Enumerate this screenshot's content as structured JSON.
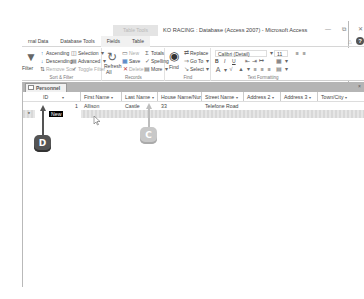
{
  "titlebar": {
    "context_tab_group": "Table Tools",
    "title": "KO RACING : Database (Access 2007) - Microsoft Access",
    "controls": {
      "minimize": "—",
      "restore": "⧉",
      "close": "✕"
    }
  },
  "ribbon_tabs": [
    {
      "label": "rnal Data"
    },
    {
      "label": "Database Tools"
    },
    {
      "label": "Fields"
    },
    {
      "label": "Table"
    }
  ],
  "ribbon": {
    "sort_filter": {
      "group_label": "Sort & Filter",
      "filter": "Filter",
      "ascending": "Ascending",
      "descending": "Descending",
      "remove_sort": "Remove Sort",
      "selection": "Selection",
      "advanced": "Advanced",
      "toggle_filter": "Toggle Filter"
    },
    "records": {
      "group_label": "Records",
      "refresh_all": "Refresh",
      "refresh_all_2": "All",
      "new": "New",
      "save": "Save",
      "delete": "Delete",
      "totals": "Totals",
      "spelling": "Spelling",
      "more": "More"
    },
    "find": {
      "group_label": "Find",
      "find": "Find",
      "replace": "Replace",
      "go_to": "Go To",
      "select": "Select"
    },
    "text_formatting": {
      "group_label": "Text Formatting",
      "font_name": "Calibri (Detail)",
      "font_size": "11",
      "bold": "B",
      "italic": "I",
      "underline": "U"
    }
  },
  "document": {
    "tab_label": "Personnel",
    "close": "×",
    "columns": [
      {
        "label": "ID",
        "width": 46
      },
      {
        "label": "First Name",
        "width": 41
      },
      {
        "label": "Last Name",
        "width": 36
      },
      {
        "label": "House Name/Nur",
        "width": 44
      },
      {
        "label": "Street Name",
        "width": 42
      },
      {
        "label": "Address 2",
        "width": 37
      },
      {
        "label": "Address 3",
        "width": 37
      },
      {
        "label": "Town/City",
        "width": 47
      }
    ],
    "rows": [
      {
        "id": "1",
        "first_name": "Allison",
        "last_name": "Castle",
        "house": "33",
        "street": "Telefone Road",
        "address2": "",
        "address3": "",
        "town": ""
      }
    ],
    "new_row": {
      "marker": "*",
      "id": "New"
    }
  },
  "callouts": [
    {
      "label": "D",
      "color": "#545454"
    },
    {
      "label": "C",
      "color": "#c8c8c8"
    }
  ]
}
